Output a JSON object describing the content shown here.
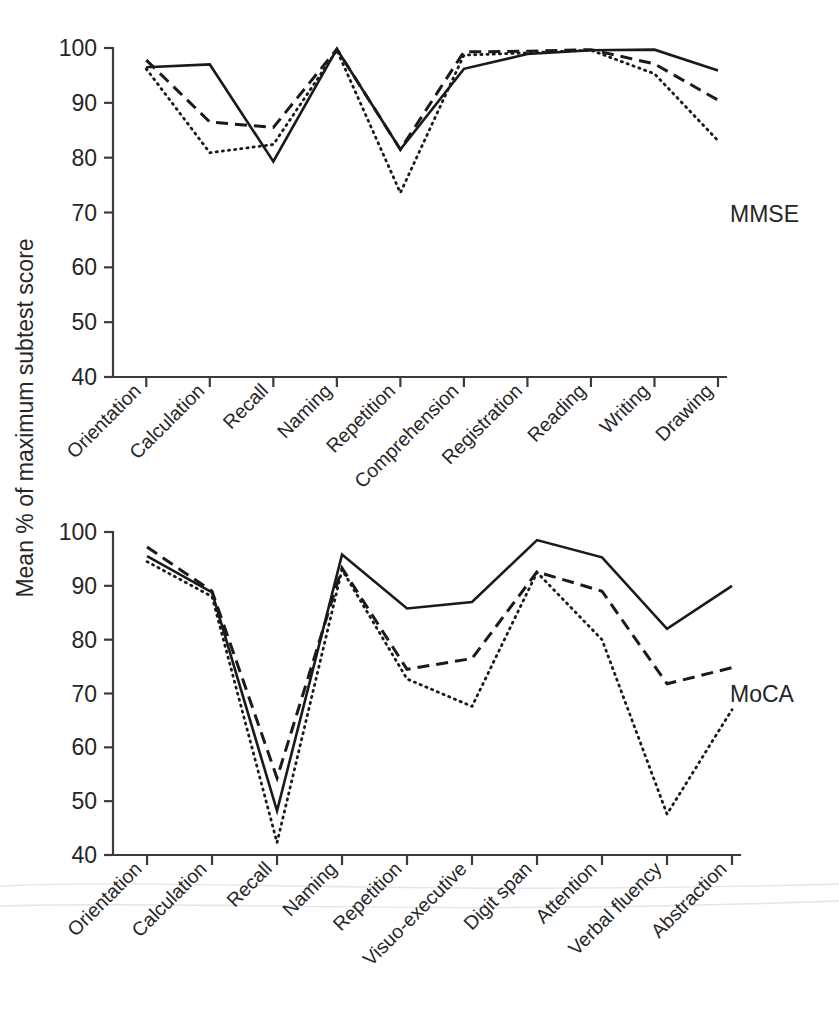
{
  "figure": {
    "axis_title": "Mean % of maximum subtest score",
    "panels": [
      {
        "label": "MMSE"
      },
      {
        "label": "MoCA"
      }
    ]
  },
  "chart_data": [
    {
      "type": "line",
      "title": "MMSE",
      "xlabel": "",
      "ylabel": "Mean % of maximum subtest score",
      "ylim": [
        40,
        100
      ],
      "yticks": [
        40,
        50,
        60,
        70,
        80,
        90,
        100
      ],
      "grid": false,
      "legend": "none",
      "categories": [
        "Orientation",
        "Calculation",
        "Recall",
        "Naming",
        "Repetition",
        "Comprehension",
        "Registration",
        "Reading",
        "Writing",
        "Drawing"
      ],
      "series": [
        {
          "name": "solid",
          "style": "solid",
          "values": [
            96.5,
            97.0,
            79.3,
            99.8,
            81.5,
            96.2,
            98.9,
            99.6,
            99.7,
            95.9
          ]
        },
        {
          "name": "dashed",
          "style": "dashed",
          "values": [
            97.8,
            86.5,
            85.5,
            99.8,
            81.5,
            99.3,
            99.4,
            99.7,
            97.1,
            90.5
          ]
        },
        {
          "name": "dotted",
          "style": "dotted",
          "values": [
            96.2,
            80.9,
            82.4,
            99.6,
            73.6,
            98.7,
            99.1,
            99.6,
            95.3,
            83.1
          ]
        }
      ]
    },
    {
      "type": "line",
      "title": "MoCA",
      "xlabel": "",
      "ylabel": "Mean % of maximum subtest score",
      "ylim": [
        40,
        100
      ],
      "yticks": [
        40,
        50,
        60,
        70,
        80,
        90,
        100
      ],
      "grid": false,
      "legend": "none",
      "categories": [
        "Orientation",
        "Calculation",
        "Recall",
        "Naming",
        "Repetition",
        "Visuo-executive",
        "Digit span",
        "Attention",
        "Verbal fluency",
        "Abstraction"
      ],
      "series": [
        {
          "name": "solid",
          "style": "solid",
          "values": [
            95.5,
            88.8,
            48.2,
            95.8,
            85.8,
            87.0,
            98.5,
            95.3,
            82.0,
            90.0
          ]
        },
        {
          "name": "dashed",
          "style": "dashed",
          "values": [
            97.2,
            89.0,
            54.3,
            93.3,
            74.5,
            76.5,
            92.6,
            89.0,
            71.8,
            74.8
          ]
        },
        {
          "name": "dotted",
          "style": "dotted",
          "values": [
            94.5,
            88.0,
            42.3,
            93.0,
            72.7,
            67.6,
            92.5,
            80.0,
            47.6,
            67.0
          ]
        }
      ]
    }
  ]
}
